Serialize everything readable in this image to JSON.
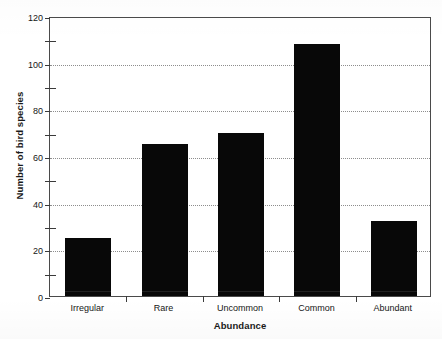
{
  "chart_data": {
    "type": "bar",
    "title": "",
    "xlabel": "Abundance",
    "ylabel": "Number of bird species",
    "categories": [
      "Irregular",
      "Rare",
      "Uncommon",
      "Common",
      "Abundant"
    ],
    "values": [
      25,
      65,
      70,
      108,
      32
    ],
    "ylim": [
      0,
      120
    ],
    "ytick_labels": [
      "0",
      "20",
      "40",
      "60",
      "80",
      "100",
      "120"
    ],
    "ytick_values": [
      0,
      20,
      40,
      60,
      80,
      100,
      120
    ],
    "yminor_values": [
      10,
      30,
      50,
      70,
      90,
      110
    ],
    "grid": "horizontal-dotted",
    "legend": "none",
    "bar_color": "#080808",
    "axis_color": "#4a4a4a",
    "grid_color": "#8d8d8d",
    "background_color": "#ffffff"
  },
  "axis": {
    "y_title": "Number of bird species",
    "x_title": "Abundance"
  },
  "ticks": {
    "y": [
      {
        "label": "120",
        "value": 120
      },
      {
        "label": "100",
        "value": 100
      },
      {
        "label": "80",
        "value": 80
      },
      {
        "label": "60",
        "value": 60
      },
      {
        "label": "40",
        "value": 40
      },
      {
        "label": "20",
        "value": 20
      },
      {
        "label": "0",
        "value": 0
      }
    ]
  }
}
